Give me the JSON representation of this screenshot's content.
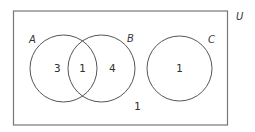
{
  "diagram": {
    "type": "venn",
    "universe_label": "U",
    "sets": [
      {
        "name": "A",
        "label": "A"
      },
      {
        "name": "B",
        "label": "B"
      },
      {
        "name": "C",
        "label": "C"
      }
    ],
    "regions": {
      "only_A": "3",
      "A_and_B": "1",
      "only_B": "4",
      "only_C": "1",
      "outside": "1"
    },
    "colors": {
      "stroke": "#555555",
      "text": "#333333"
    }
  }
}
